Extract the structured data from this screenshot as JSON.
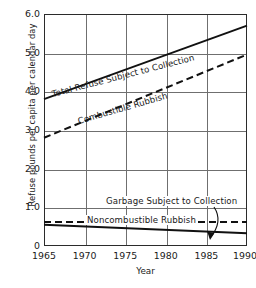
{
  "chart_data": {
    "type": "line",
    "title": "",
    "xlabel": "Year",
    "ylabel": "Refuse pounds per capita per calendar day",
    "xlim": [
      1965,
      1990
    ],
    "ylim": [
      0,
      6.0
    ],
    "grid": true,
    "legend_position": "inline-annotations",
    "xticks": [
      "1965",
      "1970",
      "1975",
      "1980",
      "1985",
      "1990"
    ],
    "xtick_values": [
      1965,
      1970,
      1975,
      1980,
      1985,
      1990
    ],
    "yticks": [
      "0",
      "1.0",
      "2.0",
      "3.0",
      "4.0",
      "5.0",
      "6.0"
    ],
    "ytick_values": [
      0,
      1.0,
      2.0,
      3.0,
      4.0,
      5.0,
      6.0
    ],
    "series": [
      {
        "name": "Total Refuse Subject to Collection",
        "style": "solid",
        "x": [
          1965,
          1990
        ],
        "values": [
          3.8,
          5.7
        ]
      },
      {
        "name": "Combustible Rubbish",
        "style": "dashed",
        "x": [
          1965,
          1990
        ],
        "values": [
          2.8,
          4.95
        ]
      },
      {
        "name": "Garbage Subject to Collection",
        "style": "solid",
        "x": [
          1965,
          1990
        ],
        "values": [
          0.55,
          0.33
        ]
      },
      {
        "name": "Noncombustible Rubbish",
        "style": "dashed",
        "x": [
          1965,
          1990
        ],
        "values": [
          0.62,
          0.62
        ]
      }
    ],
    "annotations": [
      {
        "text": "Garbage Subject to Collection",
        "kind": "curved-arrow-to-series",
        "target_series": "Garbage Subject to Collection"
      }
    ]
  },
  "labels": {
    "total_refuse": "Total Refuse Subject to Collection",
    "combustible": "Combustible Rubbish",
    "garbage": "Garbage Subject to Collection",
    "noncombustible": "Noncombustible Rubbish",
    "y_axis": "Refuse pounds per capita per calendar day",
    "x_axis": "Year"
  },
  "ticks": {
    "y": [
      "6.0",
      "5.0",
      "4.0",
      "3.0",
      "2.0",
      "1.0",
      "0"
    ],
    "x": [
      "1965",
      "1970",
      "1975",
      "1980",
      "1985",
      "1990"
    ]
  },
  "colors": {
    "line": "#111111",
    "grid": "#6f6f6f",
    "frame": "#2b2b2b",
    "background": "#ffffff"
  }
}
